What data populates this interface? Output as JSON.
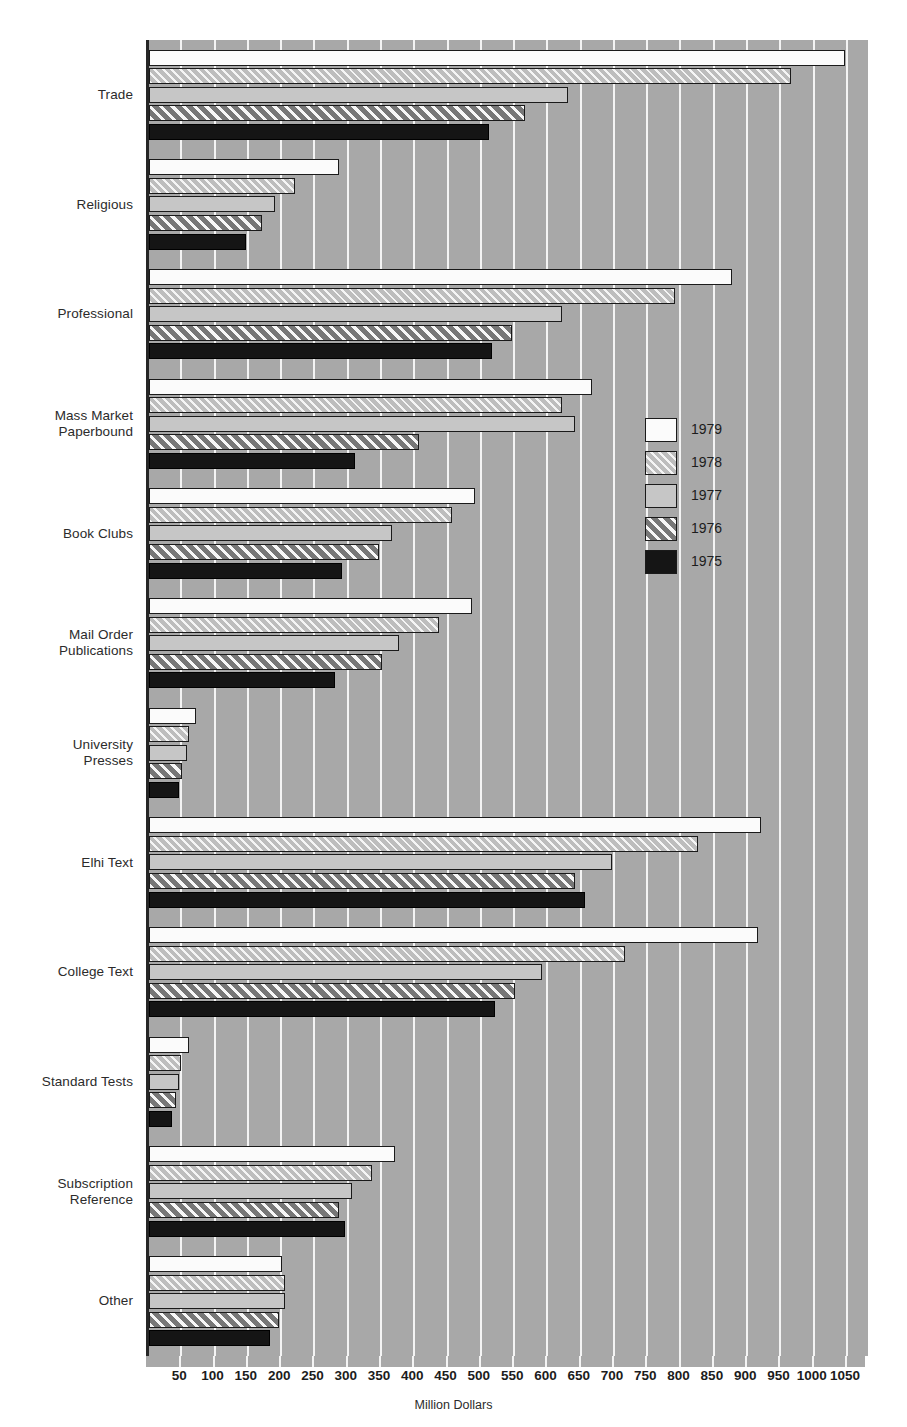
{
  "chart_data": {
    "type": "bar",
    "orientation": "horizontal",
    "title": "",
    "xlabel": "Million Dollars",
    "ylabel": "",
    "xlim": [
      0,
      1080
    ],
    "grid": true,
    "legend_position": "inside-right",
    "xticks": [
      50,
      100,
      150,
      200,
      250,
      300,
      350,
      400,
      450,
      500,
      550,
      600,
      650,
      700,
      750,
      800,
      850,
      900,
      950,
      1000,
      1050
    ],
    "xtick_labels": [
      "50",
      "100",
      "150",
      "200",
      "250",
      "300",
      "350",
      "400",
      "450",
      "500",
      "550",
      "600",
      "650",
      "700",
      "750",
      "800",
      "850",
      "900",
      "950",
      "1000",
      "1050"
    ],
    "categories": [
      "Trade",
      "Religious",
      "Professional",
      "Mass Market Paperbound",
      "Book Clubs",
      "Mail Order Publications",
      "University Presses",
      "Elhi Text",
      "College Text",
      "Standard Tests",
      "Subscription Reference",
      "Other"
    ],
    "category_lines": [
      [
        "Trade"
      ],
      [
        "Religious"
      ],
      [
        "Professional"
      ],
      [
        "Mass Market",
        "Paperbound"
      ],
      [
        "Book Clubs"
      ],
      [
        "Mail Order",
        "Publications"
      ],
      [
        "University",
        "Presses"
      ],
      [
        "Elhi Text"
      ],
      [
        "College Text"
      ],
      [
        "Standard Tests"
      ],
      [
        "Subscription",
        "Reference"
      ],
      [
        "Other"
      ]
    ],
    "series": [
      {
        "name": "1979",
        "fill": "white",
        "values": [
          1045,
          285,
          875,
          665,
          490,
          485,
          70,
          920,
          915,
          60,
          370,
          200
        ]
      },
      {
        "name": "1978",
        "fill": "light-hatch",
        "values": [
          965,
          220,
          790,
          620,
          455,
          435,
          60,
          825,
          715,
          48,
          335,
          205
        ]
      },
      {
        "name": "1977",
        "fill": "light-gray",
        "values": [
          630,
          190,
          620,
          640,
          365,
          375,
          57,
          695,
          590,
          45,
          305,
          205
        ]
      },
      {
        "name": "1976",
        "fill": "dark-hatch",
        "values": [
          565,
          170,
          545,
          405,
          345,
          350,
          50,
          640,
          550,
          40,
          285,
          195
        ]
      },
      {
        "name": "1975",
        "fill": "black",
        "values": [
          510,
          145,
          515,
          310,
          290,
          280,
          45,
          655,
          520,
          35,
          295,
          182
        ]
      }
    ]
  },
  "legend": {
    "entries": [
      {
        "label": "1979",
        "fill": "white"
      },
      {
        "label": "1978",
        "fill": "light-hatch"
      },
      {
        "label": "1977",
        "fill": "light-gray"
      },
      {
        "label": "1976",
        "fill": "dark-hatch"
      },
      {
        "label": "1975",
        "fill": "black"
      }
    ]
  },
  "colors": {
    "plot_background": "#a8a8a8",
    "gridline": "#f8f8f8",
    "axis": "#262626",
    "series_1979": "#fbfbfb",
    "series_1978": "#bdbdbd",
    "series_1977": "#c6c6c6",
    "series_1976": "#9a9a9a",
    "series_1975": "#151515",
    "text": "#1c1c1c"
  }
}
